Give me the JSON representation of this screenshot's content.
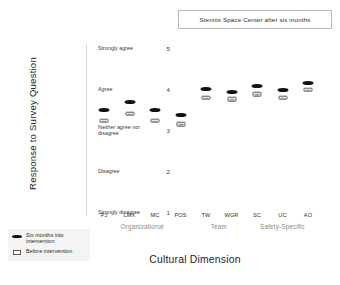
{
  "chart_data": {
    "type": "scatter",
    "title": "Stennis Space Center after six months",
    "xlabel": "Cultural Dimension",
    "ylabel": "Response to Survey Question",
    "categories": [
      "PJ",
      "LMX",
      "MC",
      "POS",
      "TW",
      "WGR",
      "SC",
      "UC",
      "AO"
    ],
    "ylim": [
      1,
      5
    ],
    "ytick_values": [
      5,
      4,
      3,
      2,
      1
    ],
    "ytick_labels": [
      "Strongly agree",
      "Agree",
      "Neither agree nor disagree",
      "Disagree",
      "Strongly disagree"
    ],
    "grid": false,
    "legend_position": "bottom-left",
    "series": [
      {
        "name": "Six months into intervention",
        "marker": "filled-ellipse",
        "values": [
          3.49,
          3.68,
          3.49,
          3.37,
          4.0,
          3.93,
          4.07,
          3.98,
          4.14
        ]
      },
      {
        "name": "Before intervention",
        "marker": "open-rectangle",
        "values": [
          3.23,
          3.4,
          3.23,
          3.14,
          3.79,
          3.75,
          3.88,
          3.79,
          3.98
        ]
      }
    ],
    "group_annotations": [
      {
        "label": "Organizational",
        "categories": [
          "PJ",
          "LMX",
          "MC",
          "POS"
        ]
      },
      {
        "label": "Team",
        "categories": [
          "TW",
          "WGR"
        ]
      },
      {
        "label": "Safety-Specific",
        "categories": [
          "SC",
          "UC",
          "AO"
        ]
      }
    ]
  },
  "colors": {
    "marker_filled": "#111111",
    "marker_open_border": "#5a5a5a",
    "group_label": "#8d8d8d",
    "legend_background": "#f4f4f4",
    "title_border": "#b9b9b9"
  }
}
